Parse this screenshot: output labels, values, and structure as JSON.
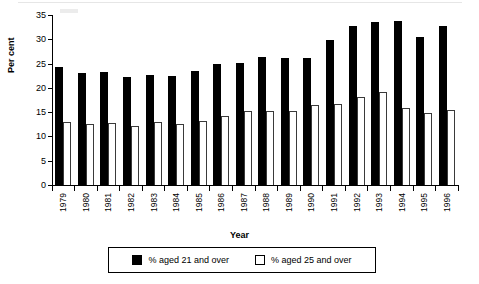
{
  "chart_data": {
    "type": "bar",
    "title": "",
    "xlabel": "Year",
    "ylabel": "Per cent",
    "ylim": [
      0,
      35
    ],
    "yticks": [
      0,
      5,
      10,
      15,
      20,
      25,
      30,
      35
    ],
    "grid": false,
    "legend_position": "bottom",
    "categories": [
      "1979",
      "1980",
      "1981",
      "1982",
      "1983",
      "1984",
      "1985",
      "1986",
      "1987",
      "1988",
      "1989",
      "1990",
      "1991",
      "1992",
      "1993",
      "1994",
      "1995",
      "1996"
    ],
    "series": [
      {
        "name": "% aged 21 and over",
        "color": "#000000",
        "values": [
          24.3,
          23.0,
          23.2,
          22.3,
          22.7,
          22.4,
          23.4,
          24.9,
          25.2,
          26.3,
          26.1,
          26.2,
          29.8,
          32.7,
          33.5,
          33.7,
          30.5,
          32.8
        ]
      },
      {
        "name": "% aged 25 and over",
        "color": "#ffffff",
        "values": [
          12.9,
          12.5,
          12.8,
          12.1,
          12.9,
          12.6,
          13.2,
          14.3,
          15.2,
          15.3,
          15.2,
          16.5,
          16.7,
          18.1,
          19.1,
          15.8,
          14.9,
          15.4
        ]
      }
    ]
  },
  "legend": {
    "items": [
      {
        "label": "% aged 21 and over",
        "swatch": "filled-black-square"
      },
      {
        "label": "% aged 25 and over",
        "swatch": "open-white-square"
      }
    ]
  }
}
